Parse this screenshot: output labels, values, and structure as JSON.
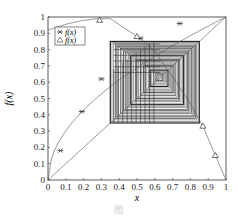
{
  "chart_data": {
    "type": "line",
    "title": "",
    "xlabel": "x",
    "ylabel": "f(x)",
    "xlim": [
      0,
      1
    ],
    "ylim": [
      0,
      1
    ],
    "xticks": [
      "0",
      "0.1",
      "0.2",
      "0.3",
      "0.4",
      "0.5",
      "0.6",
      "0.7",
      "0.8",
      "0.9",
      "1"
    ],
    "yticks": [
      "0",
      "0.1",
      "0.2",
      "0.3",
      "0.4",
      "0.5",
      "0.6",
      "0.7",
      "0.8",
      "0.9",
      "1"
    ],
    "legend": [
      {
        "label": "f(x)",
        "marker": "star"
      },
      {
        "label": "f(x)",
        "marker": "triangle"
      }
    ],
    "legend_position": "upper left",
    "series": [
      {
        "name": "f(x) star",
        "description": "concave curve from (0,0) to (1,1) through x≈0.35,0.7",
        "markers": [
          [
            0.07,
            0.18
          ],
          [
            0.19,
            0.42
          ],
          [
            0.3,
            0.62
          ],
          [
            0.52,
            0.87
          ],
          [
            0.74,
            0.96
          ]
        ]
      },
      {
        "name": "f(x) triangle",
        "description": "tent-like map rising to near 1 then falling to 0 at x=1",
        "markers": [
          [
            0.29,
            0.98
          ],
          [
            0.5,
            0.88
          ],
          [
            0.87,
            0.33
          ],
          [
            0.94,
            0.15
          ]
        ]
      },
      {
        "name": "diagonal",
        "description": "line y = x"
      }
    ],
    "cobweb": {
      "x_range": [
        0.35,
        0.85
      ],
      "y_range": [
        0.35,
        0.85
      ],
      "center": [
        0.63,
        0.63
      ]
    }
  },
  "caption": "图"
}
